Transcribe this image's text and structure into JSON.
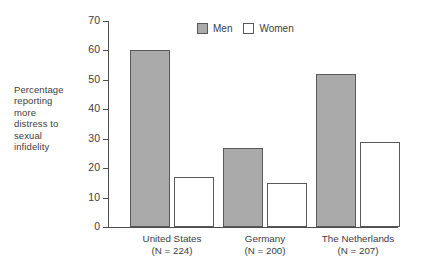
{
  "chart_data": {
    "type": "bar",
    "title": "",
    "xlabel": "",
    "ylabel": "Percentage reporting more distress to sexual infidelity",
    "ylabel_lines": [
      "Percentage",
      "reporting",
      "more",
      "distress to",
      "sexual",
      "infidelity"
    ],
    "categories": [
      "United States",
      "Germany",
      "The Netherlands"
    ],
    "category_sublabels": [
      "(N = 224)",
      "(N = 200)",
      "(N = 207)"
    ],
    "series": [
      {
        "name": "Men",
        "values": [
          60,
          27,
          52
        ],
        "color": "#a9aaa9"
      },
      {
        "name": "Women",
        "values": [
          17,
          15,
          29
        ],
        "color": "#ffffff"
      }
    ],
    "ylim": [
      0,
      70
    ],
    "yticks": [
      0,
      10,
      20,
      30,
      40,
      50,
      60,
      70
    ],
    "ytick_labels": [
      "0",
      "10",
      "20",
      "30",
      "40",
      "50",
      "60",
      "70"
    ],
    "grid": false,
    "legend_position": "top-center"
  },
  "legend": {
    "items": [
      {
        "label": "Men",
        "swatch": "gray-filled-square"
      },
      {
        "label": "Women",
        "swatch": "white-outlined-square"
      }
    ]
  },
  "colors": {
    "men_fill": "#a9aaa9",
    "women_fill": "#ffffff",
    "outline": "#595959",
    "axis": "#4d4d4d",
    "text": "#3d3d3d",
    "background": "#ffffff"
  }
}
